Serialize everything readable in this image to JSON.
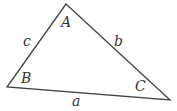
{
  "diagram": {
    "type": "triangle",
    "stroke_color": "#444444",
    "fill_color": "#ffffff",
    "vertices": [
      {
        "name": "A",
        "x": 66,
        "y": 4,
        "label_x": 61,
        "label_y": 27
      },
      {
        "name": "B",
        "x": 7,
        "y": 87,
        "label_x": 21,
        "label_y": 83
      },
      {
        "name": "C",
        "x": 170,
        "y": 100,
        "label_x": 135,
        "label_y": 91
      }
    ],
    "sides": [
      {
        "name": "a",
        "between": "B-C",
        "label_x": 72,
        "label_y": 106
      },
      {
        "name": "b",
        "between": "A-C",
        "label_x": 114,
        "label_y": 46
      },
      {
        "name": "c",
        "between": "A-B",
        "label_x": 23,
        "label_y": 46
      }
    ]
  }
}
